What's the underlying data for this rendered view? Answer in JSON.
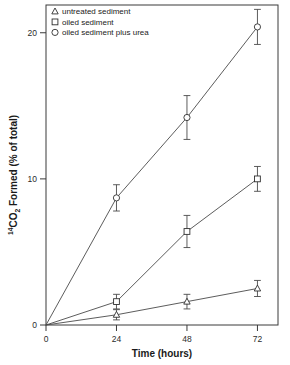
{
  "chart_data": {
    "type": "line",
    "title": "",
    "xlabel": "Time (hours)",
    "ylabel": "14CO2 Formed (% of total)",
    "ylabel_parts": {
      "superscript": "14",
      "base1": "CO",
      "subscript": "2",
      "base2": " Formed (% of total)"
    },
    "x": [
      0,
      24,
      48,
      72
    ],
    "xticks": [
      "0",
      "24",
      "48",
      "72"
    ],
    "yticks": [
      "0",
      "10",
      "20"
    ],
    "ytick_values": [
      0,
      10,
      20
    ],
    "xlim": [
      0,
      79
    ],
    "ylim": [
      0,
      21.9
    ],
    "grid": false,
    "legend_position": "top-left",
    "series": [
      {
        "name": "untreated sediment",
        "marker": "triangle",
        "values": [
          0,
          0.7,
          1.6,
          2.5
        ],
        "errors": [
          0,
          0.35,
          0.5,
          0.55
        ]
      },
      {
        "name": "oiled sediment",
        "marker": "square",
        "values": [
          0,
          1.6,
          6.4,
          10.0
        ],
        "errors": [
          0,
          0.5,
          1.1,
          0.85
        ]
      },
      {
        "name": "oiled sediment plus urea",
        "marker": "circle",
        "values": [
          0,
          8.7,
          14.2,
          20.4
        ],
        "errors": [
          0,
          0.9,
          1.5,
          1.2
        ]
      }
    ]
  },
  "legend": {
    "items": [
      {
        "label": "untreated sediment",
        "marker": "triangle"
      },
      {
        "label": "oiled sediment",
        "marker": "square"
      },
      {
        "label": "oiled sediment plus urea",
        "marker": "circle"
      }
    ]
  },
  "colors": {
    "axis": "#3a3a3a",
    "line": "#4a4a4a",
    "marker_stroke": "#2f2f2f",
    "marker_fill": "#ffffff",
    "text": "#1a1a1a",
    "background": "#ffffff"
  }
}
